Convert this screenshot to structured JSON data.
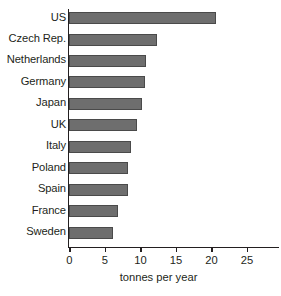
{
  "chart_data": {
    "type": "bar",
    "orientation": "horizontal",
    "title": "",
    "subtitle": "",
    "xlabel": "tonnes per year",
    "ylabel": "",
    "categories": [
      "US",
      "Czech Rep.",
      "Netherlands",
      "Germany",
      "Japan",
      "UK",
      "Italy",
      "Poland",
      "Spain",
      "France",
      "Sweden"
    ],
    "values": [
      20.7,
      12.3,
      10.8,
      10.6,
      10.2,
      9.5,
      8.7,
      8.2,
      8.2,
      6.9,
      6.2
    ],
    "series": [
      {
        "name": "tonnes per year",
        "values": [
          20.7,
          12.3,
          10.8,
          10.6,
          10.2,
          9.5,
          8.7,
          8.2,
          8.2,
          6.9,
          6.2
        ]
      }
    ],
    "xlim": [
      0,
      28
    ],
    "xticks": [
      0,
      5,
      10,
      15,
      20,
      25
    ],
    "xtick_labels": [
      "0",
      "5",
      "10",
      "15",
      "20",
      "25"
    ],
    "grid": false,
    "legend": false,
    "legend_position": "none",
    "bar_color": "#6e6e6e",
    "bar_edge_color": "#4a4a4a",
    "axis_color": "#231f20",
    "text_color": "#231f20",
    "background_color": "#ffffff"
  }
}
